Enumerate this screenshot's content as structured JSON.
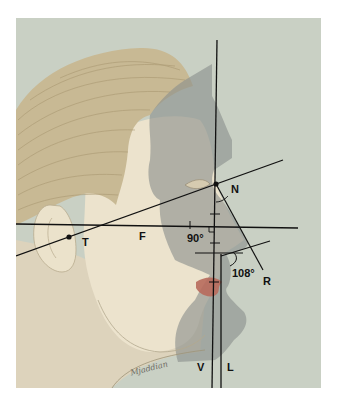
{
  "figure": {
    "background_color": "#c9d0c4",
    "skin_color": "#e9dfc8",
    "hair_color": "#c7b78f",
    "shadow_color": "#8f9390",
    "lip_color": "#b86a5c",
    "line_color": "#111111"
  },
  "labels": {
    "N": "N",
    "T": "T",
    "F": "F",
    "R": "R",
    "V": "V",
    "L": "L",
    "angle_90": "90°",
    "angle_108": "108°"
  },
  "signature": "Mjaddian"
}
